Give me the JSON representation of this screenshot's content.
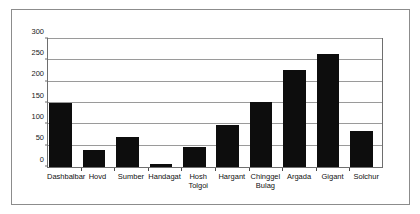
{
  "chart_data": {
    "type": "bar",
    "title": "",
    "subtitle": "",
    "xlabel": "",
    "ylabel": "",
    "categories": [
      "Dashbalbar",
      "Hovd",
      "Sumber",
      "Handagat",
      "Hosh\nTolgoi",
      "Hargant",
      "Chinggel\nBulag",
      "Argada",
      "Gigant",
      "Solchur"
    ],
    "values": [
      149,
      41,
      70,
      8,
      48,
      98,
      153,
      228,
      265,
      84
    ],
    "series": [
      {
        "name": "",
        "values": [
          149,
          41,
          70,
          8,
          48,
          98,
          153,
          228,
          265,
          84
        ]
      }
    ],
    "ylim": [
      0,
      300
    ],
    "ytick_labels": [
      "0",
      "50",
      "100",
      "150",
      "200",
      "250",
      "300"
    ],
    "ytick_values": [
      0,
      50,
      100,
      150,
      200,
      250,
      300
    ],
    "grid": true,
    "grid_axis": "y",
    "legend": false,
    "legend_position": "none",
    "bar_color": "#0d0d0d",
    "gridline_color": "#9a9a9a",
    "axis_color": "#6e6e6e",
    "background_color": "#ffffff",
    "border_color": "#8c8c8c"
  }
}
